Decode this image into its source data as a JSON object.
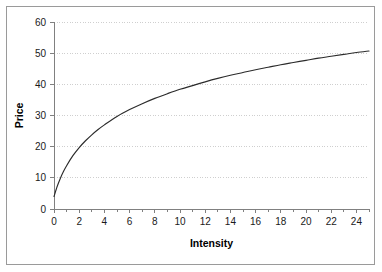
{
  "chart_data": {
    "type": "line",
    "title": "",
    "subtitle": "",
    "xlabel": "Intensity",
    "ylabel": "Price",
    "xlim": [
      0,
      25
    ],
    "ylim": [
      0,
      60
    ],
    "xticks": [
      0,
      2,
      4,
      6,
      8,
      10,
      12,
      14,
      16,
      18,
      20,
      22,
      24
    ],
    "xtick_labels": [
      "0",
      "2",
      "4",
      "6",
      "8",
      "10",
      "12",
      "14",
      "16",
      "18",
      "20",
      "22",
      "24"
    ],
    "x_minor_ticks": [
      1,
      3,
      5,
      7,
      9,
      11,
      13,
      15,
      17,
      19,
      21,
      23,
      25
    ],
    "yticks": [
      0,
      10,
      20,
      30,
      40,
      50,
      60
    ],
    "ytick_labels": [
      "0",
      "10",
      "20",
      "30",
      "40",
      "50",
      "60"
    ],
    "grid": {
      "horizontal": true,
      "vertical": false,
      "style": "dotted",
      "color": "#cfcfcf"
    },
    "legend": {
      "visible": false,
      "position": "none",
      "entries": []
    },
    "annotations": [],
    "series": [
      {
        "name": "Price vs Intensity",
        "color": "#2b2b2b",
        "marker": "none",
        "line_style": "solid",
        "x": [
          0,
          0.25,
          0.5,
          0.75,
          1,
          1.5,
          2,
          2.5,
          3,
          3.5,
          4,
          5,
          6,
          7,
          8,
          9,
          10,
          11,
          12,
          13,
          14,
          15,
          16,
          17,
          18,
          19,
          20,
          21,
          22,
          23,
          24,
          25
        ],
        "y": [
          4.0,
          7.2,
          9.8,
          12.0,
          13.9,
          17.1,
          19.7,
          21.9,
          23.8,
          25.5,
          27.0,
          29.7,
          31.9,
          33.8,
          35.5,
          37.0,
          38.4,
          39.6,
          40.8,
          41.9,
          42.9,
          43.8,
          44.7,
          45.5,
          46.3,
          47.0,
          47.7,
          48.4,
          49.0,
          49.6,
          50.2,
          50.7
        ]
      }
    ]
  },
  "plot": {
    "background_color": "#ffffff",
    "border_color": "#9a9a9a",
    "axis_color": "#808080"
  }
}
